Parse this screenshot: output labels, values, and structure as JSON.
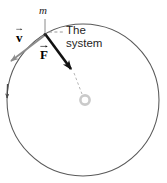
{
  "figure": {
    "kind": "physics-circular-motion-diagram",
    "width": 167,
    "height": 183,
    "background_color": "#ffffff"
  },
  "labels": {
    "mass": "m",
    "velocity_vector": "v",
    "force_vector": "F",
    "annotation_line1": "The",
    "annotation_line2": "system"
  },
  "colors": {
    "circle_stroke": "#595959",
    "velocity_arrow": "#8c8c8c",
    "force_arrow": "#111111",
    "dashed_leader": "#9a9a9a",
    "dashed_radius": "#b0b0b0",
    "center_ring": "#c8c8c8",
    "direction_tick": "#4a4a4a",
    "text": "#1a1a1a"
  },
  "geometry": {
    "circle": {
      "cx": 83,
      "cy": 100,
      "r": 76
    },
    "mass_point": {
      "x": 45,
      "y": 34
    },
    "velocity_arrow": {
      "x1": 44,
      "y1": 36,
      "x2": 9,
      "y2": 63
    },
    "force_arrow": {
      "x1": 46,
      "y1": 35,
      "x2": 73,
      "y2": 72
    },
    "dashed_radius": {
      "x1": 73,
      "y1": 72,
      "x2": 83,
      "y2": 96
    },
    "center_ring": {
      "cx": 85,
      "cy": 100,
      "r_outer": 6,
      "r_inner": 3
    },
    "leader_line": {
      "x1": 49,
      "y1": 32,
      "x2": 64,
      "y2": 32
    },
    "direction_tick": {
      "x": 8,
      "y": 91
    },
    "mass_tick": {
      "x1": 45,
      "y1": 18,
      "x2": 45,
      "y2": 36
    }
  }
}
